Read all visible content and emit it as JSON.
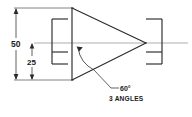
{
  "drawing": {
    "title": "Conical feature dimension drawing",
    "background_color": "#ffffff",
    "line_color": "#2b2b2b",
    "dimensions": [
      {
        "id": "overall-height",
        "label": "50",
        "orientation": "vertical",
        "position": "left-outer"
      },
      {
        "id": "half-height",
        "label": "25",
        "orientation": "vertical",
        "position": "left-inner"
      }
    ],
    "annotations": [
      {
        "id": "apex-angle",
        "label": "60°",
        "kind": "angular-dimension"
      },
      {
        "id": "angle-count-note",
        "label": "3 ANGLES",
        "kind": "note"
      }
    ],
    "geometry": {
      "cone": {
        "name": "triangular-cone-profile",
        "base_x": 72,
        "base_top_y": 8,
        "base_bottom_y": 80,
        "apex_x": 146,
        "apex_y": 43
      },
      "centerline": {
        "y": 43,
        "x_start": 34,
        "x_end": 188
      },
      "left_bracket": {
        "name": "left-bracket",
        "x_back": 52,
        "x_tip": 68,
        "top_y": 19,
        "bottom_y": 64,
        "mid_y": 52
      },
      "right_bracket": {
        "name": "right-bracket",
        "x_back": 162,
        "x_tip": 140,
        "top_y": 19,
        "bottom_y": 64,
        "mid_y": 52
      }
    }
  }
}
